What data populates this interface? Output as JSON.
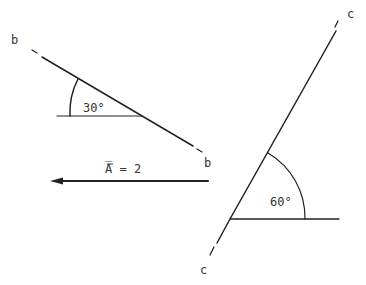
{
  "line_b": {
    "end_label_top": "b",
    "end_label_bottom": "b",
    "angle_label": "30°"
  },
  "vector": {
    "label": "A̅ = 2"
  },
  "line_c": {
    "end_label_top": "c",
    "end_label_bottom": "c",
    "angle_label": "60°"
  },
  "colors": {
    "stroke": "#222222",
    "background": "#ffffff"
  }
}
